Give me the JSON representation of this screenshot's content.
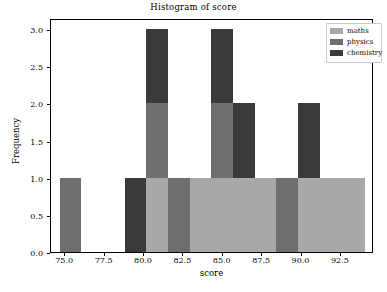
{
  "chart_data": {
    "type": "bar",
    "title": "Histogram of score",
    "xlabel": "score",
    "ylabel": "Frequency",
    "xlim": [
      74.1,
      94.6
    ],
    "ylim": [
      0,
      3.15
    ],
    "grid": false,
    "legend_position": "upper right",
    "xticks": [
      "75.0",
      "77.5",
      "80.0",
      "82.5",
      "85.0",
      "87.5",
      "90.0",
      "92.5"
    ],
    "xtick_values": [
      75.0,
      77.5,
      80.0,
      82.5,
      85.0,
      87.5,
      90.0,
      92.5
    ],
    "yticks": [
      "0.0",
      "0.5",
      "1.0",
      "1.5",
      "2.0",
      "2.5",
      "3.0"
    ],
    "ytick_values": [
      0.0,
      0.5,
      1.0,
      1.5,
      2.0,
      2.5,
      3.0
    ],
    "stacked": true,
    "series": [
      {
        "name": "maths",
        "color": "#a8a8a8",
        "values": [
          0,
          0,
          0,
          1,
          0,
          1,
          1,
          1,
          1,
          0,
          1,
          1
        ]
      },
      {
        "name": "physics",
        "color": "#6e6e6e",
        "values": [
          1,
          0,
          0,
          1,
          1,
          0,
          1,
          0,
          0,
          1,
          0,
          0
        ]
      },
      {
        "name": "chemistry",
        "color": "#3a3a3a",
        "values": [
          0,
          0,
          1,
          1,
          0,
          0,
          1,
          1,
          0,
          0,
          1,
          0
        ]
      }
    ],
    "bins": [
      {
        "left": 74.65,
        "right": 76.02,
        "total": 1
      },
      {
        "left": 76.02,
        "right": 77.4,
        "total": 0
      },
      {
        "left": 78.77,
        "right": 80.15,
        "total": 1
      },
      {
        "left": 80.15,
        "right": 81.52,
        "total": 3
      },
      {
        "left": 81.52,
        "right": 82.9,
        "total": 1
      },
      {
        "left": 82.9,
        "right": 84.27,
        "total": 1
      },
      {
        "left": 84.27,
        "right": 85.65,
        "total": 3
      },
      {
        "left": 85.65,
        "right": 87.02,
        "total": 2
      },
      {
        "left": 87.02,
        "right": 88.4,
        "total": 1
      },
      {
        "left": 88.4,
        "right": 89.77,
        "total": 1
      },
      {
        "left": 89.77,
        "right": 91.15,
        "total": 2
      },
      {
        "left": 91.15,
        "right": 94.0,
        "total": 1
      }
    ]
  },
  "legend": {
    "entries": [
      {
        "label": "maths",
        "color": "#a8a8a8"
      },
      {
        "label": "physics",
        "color": "#6e6e6e"
      },
      {
        "label": "chemistry",
        "color": "#3a3a3a"
      }
    ]
  }
}
